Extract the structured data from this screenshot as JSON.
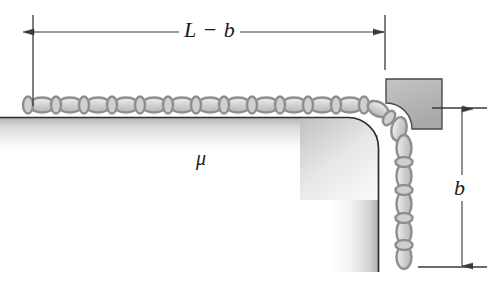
{
  "figure": {
    "background_color": "#ffffff",
    "line_color": "#3a3a3a",
    "chain_fill": "#d8d8d8",
    "chain_stroke": "#8a8a8a",
    "bracket_fill": "#b9b9b9",
    "bracket_stroke": "#4a4a4a",
    "table_edge_color": "#2b2b2b"
  },
  "labels": {
    "horizontal_dimension": "L − b",
    "vertical_dimension": "b",
    "friction_coefficient": "μ"
  },
  "dimensions": {
    "horizontal": {
      "name": "L minus b",
      "label": "L − b",
      "orientation": "horizontal",
      "line_y": 32,
      "x_start": 33,
      "x_end": 385,
      "arrowheads": "both"
    },
    "vertical": {
      "name": "b",
      "label": "b",
      "orientation": "vertical",
      "line_x": 462,
      "y_start": 108,
      "y_end": 267,
      "arrowheads": "both"
    }
  },
  "elements": {
    "table": {
      "name": "table",
      "top_surface_y": 117,
      "right_edge_x": 378,
      "corner_radius": 30
    },
    "bracket": {
      "name": "corner-bracket",
      "x": 385,
      "y": 78,
      "width": 58,
      "height": 52
    },
    "horizontal_chain": {
      "name": "chain-on-table",
      "link_count": 13,
      "start_x": 30,
      "end_x": 375,
      "y": 105
    },
    "hanging_chain": {
      "name": "hanging-chain",
      "link_count": 10,
      "x": 404,
      "top_y": 118,
      "bottom_y": 265
    }
  }
}
